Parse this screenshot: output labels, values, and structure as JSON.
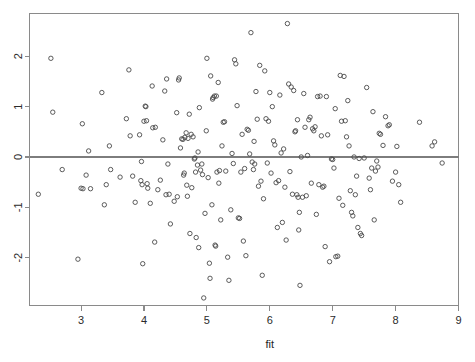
{
  "chart_data": {
    "type": "scatter",
    "title": "",
    "subtitle": "",
    "xlabel": "fit",
    "ylabel": "",
    "xlim": [
      2.18,
      9.0
    ],
    "ylim": [
      -2.95,
      2.85
    ],
    "xticks": [
      3,
      4,
      5,
      6,
      7,
      8,
      9
    ],
    "xtick_labels": [
      "3",
      "4",
      "5",
      "6",
      "7",
      "8",
      "9"
    ],
    "yticks": [
      2,
      1,
      0,
      -1,
      -2
    ],
    "ytick_labels": [
      "2",
      "1",
      "0",
      "-1",
      "-2"
    ],
    "grid": false,
    "legend": null,
    "annotations": [
      {
        "kind": "hline",
        "y": 0,
        "label": "zero-residual-reference-line"
      }
    ],
    "marker": {
      "shape": "open-circle",
      "radius_px": 2.2,
      "stroke": "#4a4a4a",
      "fill": "none"
    },
    "point_count": 248,
    "series": [
      {
        "name": "residuals",
        "points": [
          [
            2.32,
            -0.74
          ],
          [
            2.52,
            1.96
          ],
          [
            2.55,
            0.89
          ],
          [
            2.7,
            -0.25
          ],
          [
            2.95,
            -2.03
          ],
          [
            3.0,
            -0.62
          ],
          [
            3.02,
            0.66
          ],
          [
            3.03,
            -0.63
          ],
          [
            3.08,
            -0.36
          ],
          [
            3.12,
            0.12
          ],
          [
            3.15,
            -0.63
          ],
          [
            3.33,
            1.28
          ],
          [
            3.37,
            -0.95
          ],
          [
            3.4,
            -0.55
          ],
          [
            3.45,
            0.22
          ],
          [
            3.47,
            -0.25
          ],
          [
            3.62,
            -0.4
          ],
          [
            3.72,
            0.76
          ],
          [
            3.76,
            1.73
          ],
          [
            3.78,
            0.42
          ],
          [
            3.82,
            -0.38
          ],
          [
            3.86,
            -0.9
          ],
          [
            3.93,
            0.44
          ],
          [
            3.95,
            -0.47
          ],
          [
            3.96,
            -0.09
          ],
          [
            3.97,
            -0.55
          ],
          [
            3.98,
            -2.12
          ],
          [
            4.0,
            0.71
          ],
          [
            4.02,
            1.01
          ],
          [
            4.03,
            1.0
          ],
          [
            4.04,
            0.72
          ],
          [
            4.05,
            -0.53
          ],
          [
            4.06,
            -0.62
          ],
          [
            4.1,
            -0.92
          ],
          [
            4.13,
            1.41
          ],
          [
            4.14,
            0.58
          ],
          [
            4.17,
            -1.69
          ],
          [
            4.18,
            0.59
          ],
          [
            4.22,
            -0.65
          ],
          [
            4.26,
            -0.46
          ],
          [
            4.3,
            0.34
          ],
          [
            4.33,
            1.31
          ],
          [
            4.35,
            -0.75
          ],
          [
            4.36,
            1.55
          ],
          [
            4.38,
            -0.14
          ],
          [
            4.4,
            -0.74
          ],
          [
            4.42,
            -1.33
          ],
          [
            4.48,
            -0.88
          ],
          [
            4.52,
            0.88
          ],
          [
            4.53,
            -0.79
          ],
          [
            4.55,
            1.53
          ],
          [
            4.56,
            1.57
          ],
          [
            4.58,
            0.18
          ],
          [
            4.6,
            0.36
          ],
          [
            4.62,
            0.35
          ],
          [
            4.63,
            -0.36
          ],
          [
            4.64,
            -0.32
          ],
          [
            4.65,
            0.39
          ],
          [
            4.67,
            0.48
          ],
          [
            4.68,
            -0.56
          ],
          [
            4.69,
            -0.78
          ],
          [
            4.7,
            0.37
          ],
          [
            4.72,
            0.85
          ],
          [
            4.73,
            -1.52
          ],
          [
            4.75,
            0.45
          ],
          [
            4.76,
            -0.61
          ],
          [
            4.78,
            0.4
          ],
          [
            4.8,
            -0.04
          ],
          [
            4.81,
            -0.02
          ],
          [
            4.82,
            -0.3
          ],
          [
            4.83,
            -1.6
          ],
          [
            4.85,
            -0.16
          ],
          [
            4.86,
            0.1
          ],
          [
            4.87,
            -1.8
          ],
          [
            4.88,
            0.98
          ],
          [
            4.9,
            -0.26
          ],
          [
            4.92,
            -0.14
          ],
          [
            4.93,
            -0.35
          ],
          [
            4.95,
            -2.8
          ],
          [
            4.97,
            -1.12
          ],
          [
            4.99,
            0.52
          ],
          [
            5.0,
            1.96
          ],
          [
            5.02,
            -0.41
          ],
          [
            5.04,
            -2.11
          ],
          [
            5.05,
            -2.41
          ],
          [
            5.06,
            1.61
          ],
          [
            5.08,
            -0.95
          ],
          [
            5.09,
            1.15
          ],
          [
            5.1,
            1.18
          ],
          [
            5.12,
            1.21
          ],
          [
            5.13,
            -1.75
          ],
          [
            5.14,
            -1.77
          ],
          [
            5.15,
            1.21
          ],
          [
            5.16,
            -0.3
          ],
          [
            5.18,
            1.48
          ],
          [
            5.19,
            -0.52
          ],
          [
            5.2,
            -0.27
          ],
          [
            5.22,
            -1.25
          ],
          [
            5.24,
            0.22
          ],
          [
            5.26,
            0.69
          ],
          [
            5.28,
            0.7
          ],
          [
            5.3,
            -0.28
          ],
          [
            5.33,
            -1.99
          ],
          [
            5.35,
            -2.45
          ],
          [
            5.38,
            -1.05
          ],
          [
            5.4,
            0.07
          ],
          [
            5.42,
            -0.13
          ],
          [
            5.44,
            1.93
          ],
          [
            5.46,
            1.85
          ],
          [
            5.48,
            1.02
          ],
          [
            5.5,
            -1.21
          ],
          [
            5.52,
            -1.22
          ],
          [
            5.54,
            -0.3
          ],
          [
            5.56,
            0.45
          ],
          [
            5.58,
            -1.67
          ],
          [
            5.6,
            -0.23
          ],
          [
            5.62,
            -1.96
          ],
          [
            5.64,
            0.55
          ],
          [
            5.66,
            0.53
          ],
          [
            5.68,
            0.06
          ],
          [
            5.7,
            2.47
          ],
          [
            5.72,
            -0.1
          ],
          [
            5.74,
            -0.25
          ],
          [
            5.75,
            0.31
          ],
          [
            5.76,
            -0.14
          ],
          [
            5.78,
            1.3
          ],
          [
            5.8,
            0.75
          ],
          [
            5.82,
            -0.58
          ],
          [
            5.84,
            1.82
          ],
          [
            5.86,
            -0.48
          ],
          [
            5.88,
            -2.35
          ],
          [
            5.9,
            -0.83
          ],
          [
            5.92,
            1.71
          ],
          [
            5.94,
            0.76
          ],
          [
            5.96,
            -0.12
          ],
          [
            5.98,
            0.71
          ],
          [
            6.0,
            1.28
          ],
          [
            6.02,
            -0.32
          ],
          [
            6.04,
            1.0
          ],
          [
            6.06,
            0.32
          ],
          [
            6.08,
            0.24
          ],
          [
            6.1,
            -0.51
          ],
          [
            6.12,
            -1.4
          ],
          [
            6.14,
            -0.47
          ],
          [
            6.16,
            1.23
          ],
          [
            6.18,
            0.08
          ],
          [
            6.2,
            -1.3
          ],
          [
            6.22,
            0.16
          ],
          [
            6.24,
            -0.6
          ],
          [
            6.26,
            -1.65
          ],
          [
            6.28,
            2.65
          ],
          [
            6.3,
            1.45
          ],
          [
            6.32,
            -0.29
          ],
          [
            6.34,
            1.39
          ],
          [
            6.36,
            -0.74
          ],
          [
            6.38,
            1.32
          ],
          [
            6.4,
            0.5
          ],
          [
            6.41,
            0.52
          ],
          [
            6.43,
            -0.75
          ],
          [
            6.44,
            0.74
          ],
          [
            6.45,
            -0.8
          ],
          [
            6.46,
            -1.45
          ],
          [
            6.47,
            -1.1
          ],
          [
            6.48,
            -2.55
          ],
          [
            6.5,
            0.0
          ],
          [
            6.52,
            -0.8
          ],
          [
            6.54,
            1.26
          ],
          [
            6.56,
            0.59
          ],
          [
            6.58,
            -0.77
          ],
          [
            6.6,
            0.03
          ],
          [
            6.62,
            0.74
          ],
          [
            6.64,
            0.79
          ],
          [
            6.66,
            -0.52
          ],
          [
            6.68,
            0.56
          ],
          [
            6.7,
            0.52
          ],
          [
            6.72,
            0.6
          ],
          [
            6.74,
            -1.14
          ],
          [
            6.76,
            1.2
          ],
          [
            6.78,
            -0.55
          ],
          [
            6.8,
            1.21
          ],
          [
            6.82,
            0.42
          ],
          [
            6.84,
            -0.6
          ],
          [
            6.86,
            -0.58
          ],
          [
            6.88,
            -1.78
          ],
          [
            6.9,
            1.2
          ],
          [
            6.92,
            0.44
          ],
          [
            6.95,
            -2.08
          ],
          [
            6.98,
            -0.04
          ],
          [
            7.0,
            -0.05
          ],
          [
            7.02,
            -0.22
          ],
          [
            7.04,
            0.96
          ],
          [
            7.05,
            -1.98
          ],
          [
            7.08,
            -1.97
          ],
          [
            7.1,
            -0.82
          ],
          [
            7.12,
            1.62
          ],
          [
            7.14,
            0.71
          ],
          [
            7.16,
            -0.96
          ],
          [
            7.18,
            1.6
          ],
          [
            7.2,
            0.72
          ],
          [
            7.22,
            0.4
          ],
          [
            7.24,
            1.12
          ],
          [
            7.26,
            0.22
          ],
          [
            7.28,
            -0.67
          ],
          [
            7.3,
            -1.1
          ],
          [
            7.32,
            -1.17
          ],
          [
            7.34,
            0.0
          ],
          [
            7.36,
            -0.75
          ],
          [
            7.38,
            -0.38
          ],
          [
            7.4,
            -1.4
          ],
          [
            7.42,
            -0.03
          ],
          [
            7.44,
            -1.52
          ],
          [
            7.46,
            -1.56
          ],
          [
            7.5,
            -0.02
          ],
          [
            7.54,
            1.38
          ],
          [
            7.58,
            -0.42
          ],
          [
            7.6,
            -0.65
          ],
          [
            7.62,
            -0.22
          ],
          [
            7.64,
            0.9
          ],
          [
            7.66,
            -1.25
          ],
          [
            7.68,
            -0.28
          ],
          [
            7.7,
            -0.08
          ],
          [
            7.72,
            -0.2
          ],
          [
            7.74,
            0.47
          ],
          [
            7.76,
            0.45
          ],
          [
            7.8,
            0.23
          ],
          [
            7.84,
            0.8
          ],
          [
            7.88,
            0.62
          ],
          [
            7.9,
            0.64
          ],
          [
            7.95,
            -0.48
          ],
          [
            8.0,
            -0.3
          ],
          [
            8.02,
            0.21
          ],
          [
            8.05,
            -0.55
          ],
          [
            8.08,
            -0.9
          ],
          [
            8.38,
            0.69
          ],
          [
            8.58,
            0.22
          ],
          [
            8.62,
            0.3
          ],
          [
            8.74,
            -0.12
          ]
        ]
      }
    ]
  },
  "labels": {
    "x_axis_title": "fit"
  }
}
